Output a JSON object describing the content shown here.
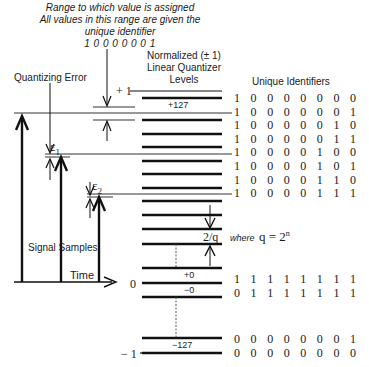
{
  "annotation": {
    "line1": "Range to which value is assigned",
    "line2": "All values in this range are given the",
    "line3": "unique identifier",
    "identifier": "1 0 0 0 0 0 0 1"
  },
  "labels": {
    "quantizing_error": "Quantizing Error",
    "levels_title_1": "Normalized (± 1)",
    "levels_title_2": "Linear Quantizer",
    "levels_title_3": "Levels",
    "unique_identifiers": "Unique Identifiers",
    "plus_one": "+ 1",
    "zero": "0",
    "minus_one": "− 1",
    "plus_127": "+127",
    "plus_0": "+0",
    "minus_0": "−0",
    "minus_127": "−127",
    "epsilon_1": "ε",
    "epsilon_1_sub": "1",
    "epsilon_2": "ε",
    "epsilon_2_sub": "2",
    "step": "2/q",
    "where": "where",
    "formula": "q = 2",
    "formula_exp": "n",
    "signal_samples": "Signal Samples",
    "time": "Time"
  },
  "identifiers": {
    "top": [
      [
        "1",
        "0",
        "0",
        "0",
        "0",
        "0",
        "0",
        "0"
      ],
      [
        "1",
        "0",
        "0",
        "0",
        "0",
        "0",
        "0",
        "1"
      ],
      [
        "1",
        "0",
        "0",
        "0",
        "0",
        "0",
        "1",
        "0"
      ],
      [
        "1",
        "0",
        "0",
        "0",
        "0",
        "0",
        "1",
        "1"
      ],
      [
        "1",
        "0",
        "0",
        "0",
        "0",
        "1",
        "0",
        "0"
      ],
      [
        "1",
        "0",
        "0",
        "0",
        "0",
        "1",
        "0",
        "1"
      ],
      [
        "1",
        "0",
        "0",
        "0",
        "0",
        "1",
        "1",
        "0"
      ],
      [
        "1",
        "0",
        "0",
        "0",
        "0",
        "1",
        "1",
        "1"
      ]
    ],
    "middle": [
      [
        "1",
        "1",
        "1",
        "1",
        "1",
        "1",
        "1",
        "1"
      ],
      [
        "0",
        "1",
        "1",
        "1",
        "1",
        "1",
        "1",
        "1"
      ]
    ],
    "bottom": [
      [
        "0",
        "0",
        "0",
        "0",
        "0",
        "0",
        "0",
        "1"
      ],
      [
        "0",
        "0",
        "0",
        "0",
        "0",
        "0",
        "0",
        "0"
      ]
    ]
  }
}
